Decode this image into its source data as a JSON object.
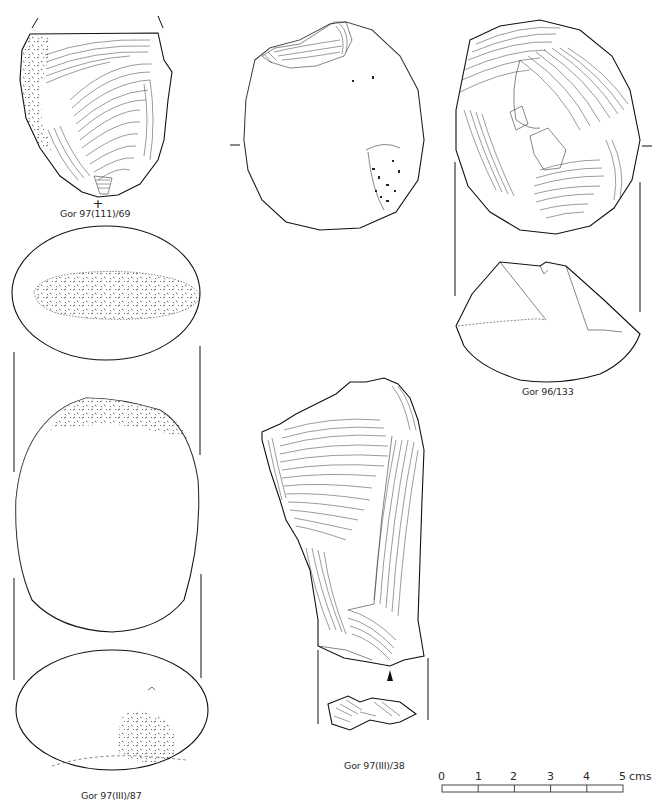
{
  "figure": {
    "specimens": [
      {
        "id": "gor-97-111-69",
        "label": "Gor 97(111)/69",
        "type": "flake with cortex",
        "marker": "+"
      },
      {
        "id": "gor-96-133",
        "label": "Gor 96/133",
        "type": "core (two views)"
      },
      {
        "id": "gor-97-iii-87",
        "label": "Gor 97(III)/87",
        "type": "pebble hammerstone (three views)"
      },
      {
        "id": "gor-97-iii-38",
        "label": "Gor 97(III)/38",
        "type": "flake with platform view",
        "marker": "arrowhead"
      }
    ],
    "scale_bar": {
      "ticks": [
        "0",
        "1",
        "2",
        "3",
        "4",
        "5"
      ],
      "unit": "cms"
    }
  }
}
